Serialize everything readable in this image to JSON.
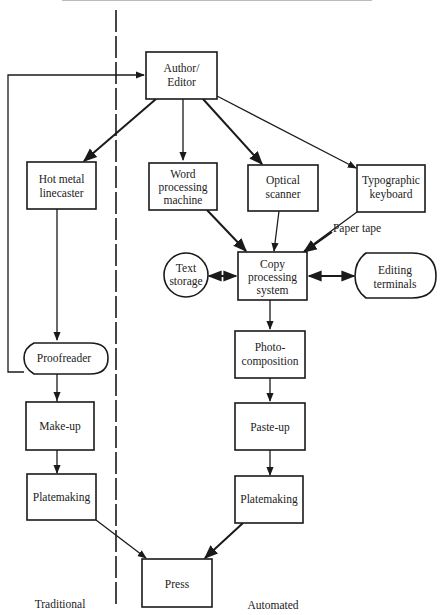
{
  "diagram": {
    "colors": {
      "ink": "#1a1a1a",
      "paper": "#ffffff"
    },
    "section_labels": {
      "left": "Traditional",
      "right": "Automated"
    },
    "nodes": {
      "author_editor": {
        "line1": "Author/",
        "line2": "Editor"
      },
      "hot_metal": {
        "line1": "Hot metal",
        "line2": "linecaster"
      },
      "word_processing": {
        "line1": "Word",
        "line2": "processing",
        "line3": "machine"
      },
      "optical_scanner": {
        "line1": "Optical",
        "line2": "scanner"
      },
      "typographic_keyboard": {
        "line1": "Typographic",
        "line2": "keyboard"
      },
      "copy_processing": {
        "line1": "Copy",
        "line2": "processing",
        "line3": "system"
      },
      "text_storage": {
        "line1": "Text",
        "line2": "storage"
      },
      "editing_terminals": {
        "line1": "Editing",
        "line2": "terminals"
      },
      "proofreader": {
        "label": "Proofreader"
      },
      "make_up": {
        "label": "Make-up"
      },
      "platemaking_left": {
        "label": "Platemaking"
      },
      "photo_composition": {
        "line1": "Photo-",
        "line2": "composition"
      },
      "paste_up": {
        "label": "Paste-up"
      },
      "platemaking_right": {
        "label": "Platemaking"
      },
      "press": {
        "label": "Press"
      }
    },
    "edge_labels": {
      "paper_tape": "Paper tape"
    },
    "edges": [
      [
        "Author/Editor",
        "Hot metal linecaster"
      ],
      [
        "Author/Editor",
        "Word processing machine"
      ],
      [
        "Author/Editor",
        "Optical scanner"
      ],
      [
        "Author/Editor",
        "Typographic keyboard"
      ],
      [
        "Hot metal linecaster",
        "Proofreader"
      ],
      [
        "Proofreader",
        "Author/Editor"
      ],
      [
        "Proofreader",
        "Make-up"
      ],
      [
        "Make-up",
        "Platemaking (traditional)"
      ],
      [
        "Platemaking (traditional)",
        "Press"
      ],
      [
        "Word processing machine",
        "Copy processing system"
      ],
      [
        "Optical scanner",
        "Copy processing system"
      ],
      [
        "Typographic keyboard",
        "Copy processing system",
        "Paper tape"
      ],
      [
        "Text storage",
        "Copy processing system",
        "bidirectional"
      ],
      [
        "Copy processing system",
        "Editing terminals",
        "bidirectional"
      ],
      [
        "Copy processing system",
        "Photo-composition"
      ],
      [
        "Photo-composition",
        "Paste-up"
      ],
      [
        "Paste-up",
        "Platemaking (automated)"
      ],
      [
        "Platemaking (automated)",
        "Press"
      ]
    ]
  }
}
